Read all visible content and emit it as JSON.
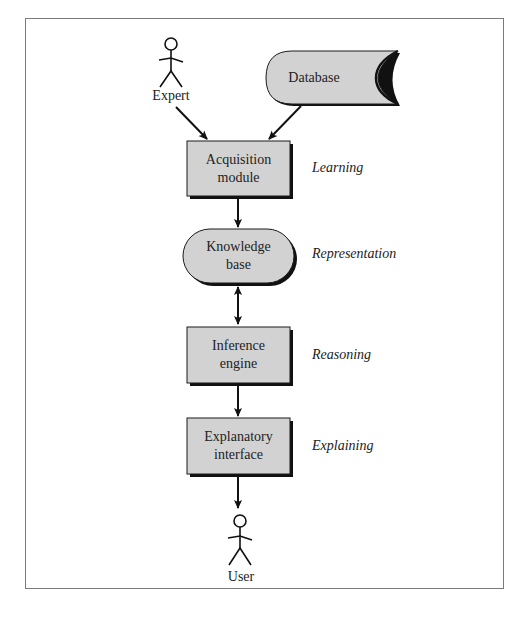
{
  "diagram": {
    "colors": {
      "box_fill": "#d2d2d2",
      "box_stroke": "#1a1a1a",
      "frame": "#7a7a7a",
      "arrow": "#111111"
    },
    "actors": [
      {
        "id": "expert",
        "label": "Expert"
      },
      {
        "id": "user",
        "label": "User"
      }
    ],
    "nodes": [
      {
        "id": "database",
        "shape": "stored-data",
        "label": "Database"
      },
      {
        "id": "acquisition",
        "shape": "rectangle",
        "line1": "Acquisition",
        "line2": "module"
      },
      {
        "id": "knowledge",
        "shape": "terminator",
        "line1": "Knowledge",
        "line2": "base"
      },
      {
        "id": "inference",
        "shape": "rectangle",
        "line1": "Inference",
        "line2": "engine"
      },
      {
        "id": "explanatory",
        "shape": "rectangle",
        "line1": "Explanatory",
        "line2": "interface"
      }
    ],
    "side_labels": {
      "acquisition": "Learning",
      "knowledge": "Representation",
      "inference": "Reasoning",
      "explanatory": "Explaining"
    },
    "edges": [
      {
        "from": "expert",
        "to": "acquisition",
        "type": "directed"
      },
      {
        "from": "database",
        "to": "acquisition",
        "type": "directed"
      },
      {
        "from": "acquisition",
        "to": "knowledge",
        "type": "directed"
      },
      {
        "from": "knowledge",
        "to": "inference",
        "type": "bidirectional"
      },
      {
        "from": "inference",
        "to": "explanatory",
        "type": "directed"
      },
      {
        "from": "explanatory",
        "to": "user",
        "type": "directed"
      }
    ]
  }
}
